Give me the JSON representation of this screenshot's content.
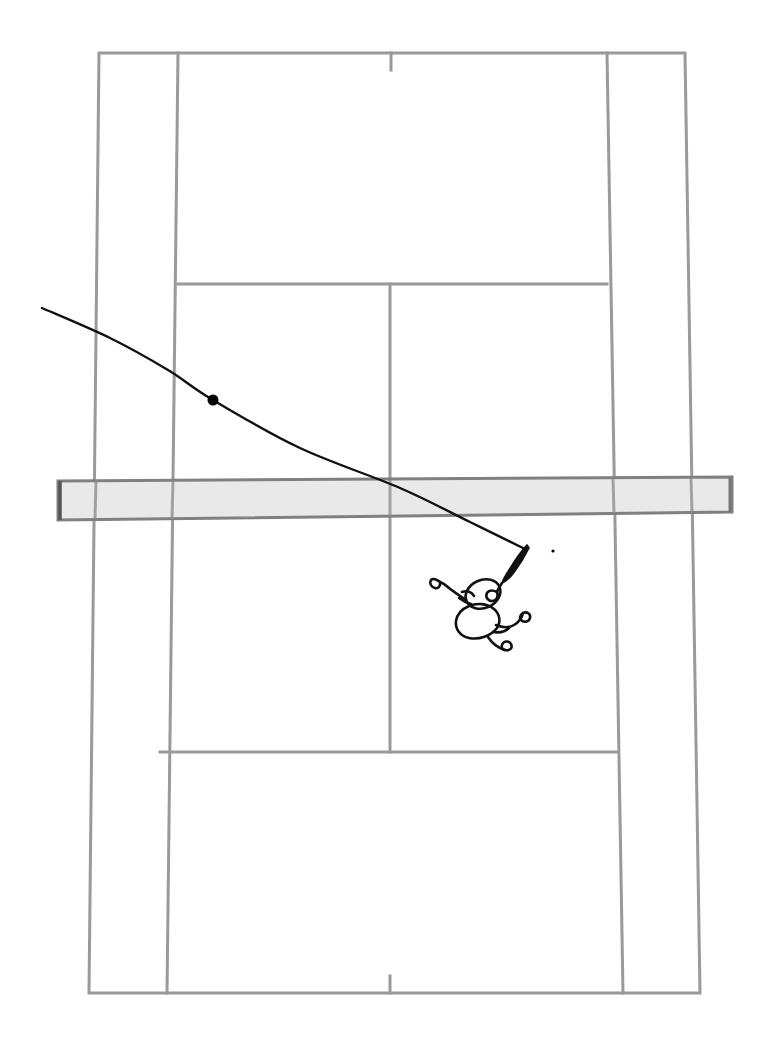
{
  "diagram": {
    "title": "Tennis court top-down shot diagram",
    "view": "overhead",
    "canvas": {
      "width": 768,
      "height": 1042
    },
    "background_color": "#ffffff"
  },
  "colors": {
    "court_line": "#9a9a9a",
    "court_line_dark": "#8a8a8a",
    "net_fill": "#e9e9e9",
    "net_border": "#808080",
    "net_post_edge": "#555555",
    "trajectory": "#111111",
    "ball": "#000000",
    "player_ink": "#111111",
    "background": "#ffffff"
  },
  "court": {
    "name": "tennis-court",
    "line_width": 3,
    "doubles_outline": [
      {
        "label": "top-left",
        "x": 99,
        "y": 53
      },
      {
        "label": "top-right",
        "x": 685,
        "y": 53
      },
      {
        "label": "bottom-right",
        "x": 700,
        "y": 993
      },
      {
        "label": "bottom-left",
        "x": 89,
        "y": 993
      }
    ],
    "singles_sidelines": [
      {
        "label": "left-singles-sideline",
        "x1": 178,
        "y1": 53,
        "x2": 167,
        "y2": 993
      },
      {
        "label": "right-singles-sideline",
        "x1": 607,
        "y1": 53,
        "x2": 623,
        "y2": 993
      }
    ],
    "baselines": [
      {
        "label": "far-baseline",
        "x1": 99,
        "y1": 53,
        "x2": 685,
        "y2": 53
      },
      {
        "label": "near-baseline",
        "x1": 89,
        "y1": 993,
        "x2": 700,
        "y2": 993
      }
    ],
    "service_lines": [
      {
        "label": "far-service-line",
        "x1": 178,
        "y1": 284,
        "x2": 607,
        "y2": 284
      },
      {
        "label": "near-service-line",
        "x1": 160,
        "y1": 752,
        "x2": 617,
        "y2": 752
      }
    ],
    "center_service_line": {
      "label": "center-service-line",
      "x1": 390,
      "y1": 284,
      "x2": 390,
      "y2": 752
    },
    "center_marks": [
      {
        "label": "far-center-mark",
        "x": 391,
        "y1": 53,
        "y2": 70
      },
      {
        "label": "near-center-mark",
        "x": 390,
        "y1": 976,
        "y2": 993
      }
    ]
  },
  "net": {
    "name": "net-band",
    "fill": "#e9e9e9",
    "border": "#808080",
    "left_x": 58,
    "right_x": 732,
    "left_top_y": 481,
    "left_bottom_y": 520,
    "right_top_y": 477,
    "right_bottom_y": 512,
    "tilt_note": "band slopes slightly upward toward the right"
  },
  "trajectory": {
    "name": "ball-trajectory",
    "stroke": "#111111",
    "stroke_width": 2.4,
    "description": "incoming shot arcing from the far left, bouncing in the deuce court, then rising to the player's racket",
    "path_points": [
      {
        "x": 42,
        "y": 308
      },
      {
        "x": 110,
        "y": 338
      },
      {
        "x": 168,
        "y": 370
      },
      {
        "x": 213,
        "y": 400
      },
      {
        "x": 300,
        "y": 448
      },
      {
        "x": 400,
        "y": 488
      },
      {
        "x": 470,
        "y": 522
      },
      {
        "x": 525,
        "y": 549
      }
    ],
    "bounce_point": {
      "label": "ball-bounce",
      "x": 213,
      "y": 400,
      "radius": 5.5
    },
    "contact_point": {
      "label": "racket-contact",
      "x": 525,
      "y": 549
    }
  },
  "ball_marker": {
    "name": "loose-ball-dot",
    "x": 553,
    "y": 551,
    "radius": 1.6
  },
  "player": {
    "name": "tennis-player",
    "stroke": "#111111",
    "stroke_width": 2.6,
    "position": {
      "x": 487,
      "y": 598
    },
    "orientation": "overhead view, reaching up-right toward contact",
    "parts": [
      "head",
      "torso",
      "left-arm",
      "right-arm",
      "legs",
      "racket-handle",
      "racket-head"
    ],
    "racket": {
      "name": "racket",
      "handle": {
        "x1": 505,
        "y1": 583,
        "x2": 520,
        "y2": 558
      },
      "head_tip": {
        "x": 528,
        "y": 545
      }
    }
  },
  "annotations": {
    "caption": "",
    "labels": []
  }
}
